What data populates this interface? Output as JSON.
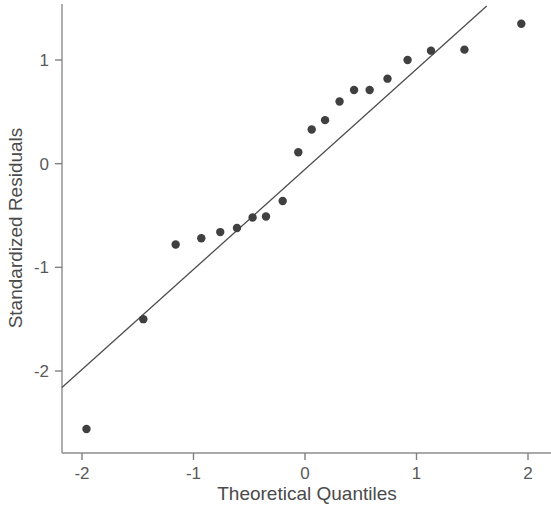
{
  "chart_data": {
    "type": "scatter",
    "title": "",
    "subtitle": "",
    "xlabel": "Theoretical Quantiles",
    "ylabel": "Standardized Residuals",
    "xlim": [
      -2.18,
      2.02
    ],
    "ylim": [
      -2.72,
      1.55
    ],
    "xticks": [
      -2,
      -1,
      0,
      1,
      2
    ],
    "xtick_labels": [
      "-2",
      "-1",
      "0",
      "1",
      "2"
    ],
    "yticks": [
      1,
      0,
      -1,
      -2
    ],
    "ytick_labels": [
      "1",
      "0",
      "-1",
      "-2"
    ],
    "grid": false,
    "legend": null,
    "point_color": "#404040",
    "line_color": "#4d4d4d",
    "axis_color": "#808080",
    "point_radius": 4.2,
    "x": [
      -1.96,
      -1.45,
      -1.16,
      -0.93,
      -0.76,
      -0.61,
      -0.47,
      -0.35,
      -0.2,
      -0.06,
      0.06,
      0.18,
      0.31,
      0.44,
      0.58,
      0.74,
      0.92,
      1.13,
      1.43,
      1.94
    ],
    "y": [
      -2.56,
      -1.5,
      -0.78,
      -0.72,
      -0.66,
      -0.62,
      -0.52,
      -0.51,
      -0.36,
      0.11,
      0.33,
      0.42,
      0.6,
      0.71,
      0.71,
      0.82,
      1.0,
      1.09,
      1.1,
      1.35
    ],
    "reference_line": {
      "x": [
        -2.18,
        1.63
      ],
      "y": [
        -2.16,
        1.52
      ],
      "slope": 0.966,
      "intercept": -0.053
    },
    "series": [
      {
        "name": "Standardized residuals vs theoretical quantiles",
        "type": "scatter",
        "points": [
          {
            "x": -1.96,
            "y": -2.56
          },
          {
            "x": -1.45,
            "y": -1.5
          },
          {
            "x": -1.16,
            "y": -0.78
          },
          {
            "x": -0.93,
            "y": -0.72
          },
          {
            "x": -0.76,
            "y": -0.66
          },
          {
            "x": -0.61,
            "y": -0.62
          },
          {
            "x": -0.47,
            "y": -0.52
          },
          {
            "x": -0.35,
            "y": -0.51
          },
          {
            "x": -0.2,
            "y": -0.36
          },
          {
            "x": -0.06,
            "y": 0.11
          },
          {
            "x": 0.06,
            "y": 0.33
          },
          {
            "x": 0.18,
            "y": 0.42
          },
          {
            "x": 0.31,
            "y": 0.6
          },
          {
            "x": 0.44,
            "y": 0.71
          },
          {
            "x": 0.58,
            "y": 0.71
          },
          {
            "x": 0.74,
            "y": 0.82
          },
          {
            "x": 0.92,
            "y": 1.0
          },
          {
            "x": 1.13,
            "y": 1.09
          },
          {
            "x": 1.43,
            "y": 1.1
          },
          {
            "x": 1.94,
            "y": 1.35
          }
        ]
      },
      {
        "name": "Reference line",
        "type": "line",
        "points": [
          {
            "x": -2.18,
            "y": -2.16
          },
          {
            "x": 1.63,
            "y": 1.52
          }
        ]
      }
    ]
  }
}
